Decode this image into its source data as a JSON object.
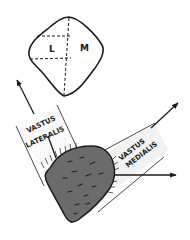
{
  "inset": {
    "lateral_label": "L",
    "medial_label": "M"
  },
  "muscles": {
    "lateral": {
      "line1": "VASTUS",
      "line2": "LATERALIS"
    },
    "medial": {
      "line1": "VASTUS",
      "line2": "MEDIALIS"
    }
  },
  "colors": {
    "ink": "#1a1a1a",
    "patella_fill": "#6b6b6b",
    "band_shade": "#f2f2f2",
    "background": "#ffffff"
  }
}
